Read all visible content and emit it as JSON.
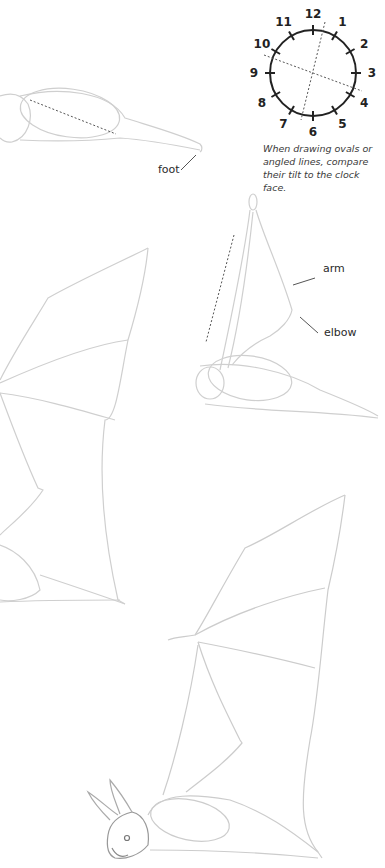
{
  "clock": {
    "numbers": [
      "12",
      "1",
      "2",
      "3",
      "4",
      "5",
      "6",
      "7",
      "8",
      "9",
      "10",
      "11"
    ],
    "caption": "When drawing ovals or angled lines, compare their tilt to the clock face."
  },
  "labels": {
    "foot": "foot",
    "arm": "arm",
    "elbow": "elbow"
  },
  "figures": [
    {
      "name": "bat-body-sketch-top"
    },
    {
      "name": "bat-wing-sketch-left"
    },
    {
      "name": "bat-folded-arm-sketch"
    },
    {
      "name": "bat-full-sketch-bottom"
    }
  ],
  "colors": {
    "pencil": "#c8c8c8",
    "ink": "#222222"
  }
}
